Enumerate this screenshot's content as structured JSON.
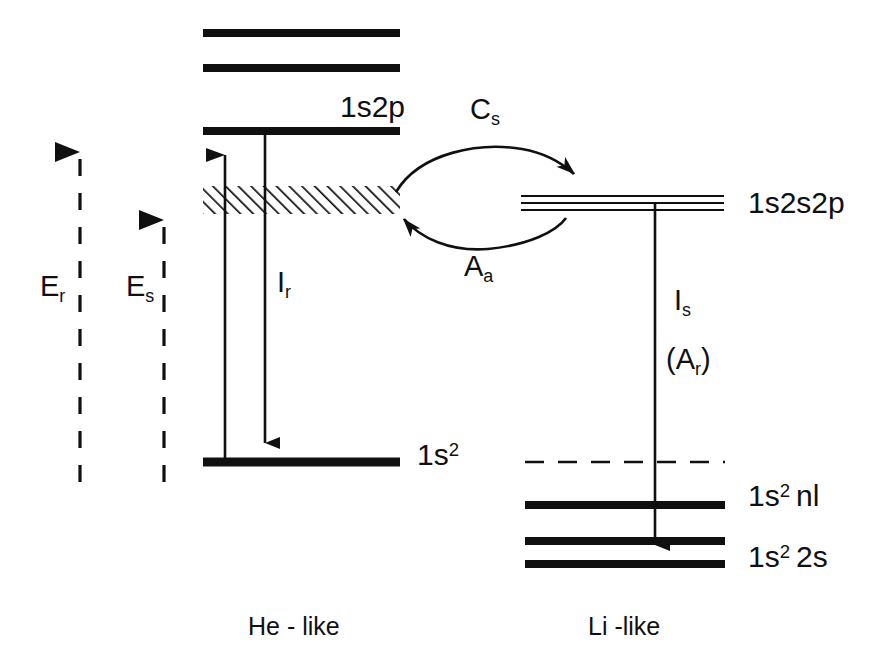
{
  "figure": {
    "type": "energy-level-diagram",
    "background_color": "#ffffff",
    "line_color": "#101010"
  },
  "columns": {
    "he_like": {
      "caption": "He - like",
      "caption_x": 248,
      "caption_y": 614
    },
    "li_like": {
      "caption": "Li -like",
      "caption_x": 588,
      "caption_y": 614
    }
  },
  "levels": [
    {
      "id": "he-upper-1",
      "label": "",
      "style": "thick",
      "x1": 203,
      "x2": 400,
      "y": 33,
      "column": "he-like"
    },
    {
      "id": "he-upper-2",
      "label": "",
      "style": "thick",
      "x1": 203,
      "x2": 400,
      "y": 68,
      "column": "he-like"
    },
    {
      "id": "he-1s2p",
      "label": "1s2p",
      "label_x": 340,
      "label_y": 92,
      "style": "thick",
      "x1": 203,
      "x2": 400,
      "y": 131,
      "column": "he-like"
    },
    {
      "id": "he-ground",
      "label": "1s",
      "label_sup": "2",
      "label_x": 417,
      "label_y": 447,
      "style": "thick",
      "x1": 203,
      "x2": 400,
      "y": 462,
      "column": "he-like"
    },
    {
      "id": "li-1s2s2p",
      "label": "1s2s2p",
      "label_x": 748,
      "label_y": 188,
      "style": "triple-thin",
      "x1": 521,
      "x2": 724,
      "y": 203,
      "column": "li-like"
    },
    {
      "id": "li-nl",
      "label": "1s",
      "label_sup": "2",
      "label_suffix": "nl",
      "label_x": 748,
      "label_y": 481,
      "style": "thick",
      "x1": 525,
      "x2": 725,
      "y": 505,
      "column": "li-like"
    },
    {
      "id": "li-2s-upper",
      "label": "",
      "style": "thick",
      "x1": 525,
      "x2": 725,
      "y": 541,
      "column": "li-like"
    },
    {
      "id": "li-2s",
      "label": "1s",
      "label_sup": "2",
      "label_suffix": "2s",
      "label_x": 748,
      "label_y": 542,
      "style": "thick",
      "x1": 525,
      "x2": 725,
      "y": 564,
      "column": "li-like"
    }
  ],
  "continuum": {
    "id": "he-continuum-band",
    "style": "hatched",
    "x1": 203,
    "x2": 400,
    "y_top": 186,
    "y_bottom": 214
  },
  "dashed_reference": {
    "id": "li-ionization-dashed",
    "x1": 525,
    "x2": 725,
    "y": 462
  },
  "energy_arrows": [
    {
      "id": "E_r",
      "label": "E",
      "label_sub": "r",
      "label_x": 40,
      "label_y": 290,
      "x": 80,
      "y_top": 128,
      "y_bottom": 482,
      "style": "dashed-up"
    },
    {
      "id": "E_s",
      "label": "E",
      "label_sub": "s",
      "label_x": 126,
      "label_y": 290,
      "x": 164,
      "y_top": 196,
      "y_bottom": 482,
      "style": "dashed-up"
    }
  ],
  "transitions": [
    {
      "id": "excitation",
      "label": "",
      "x": 225,
      "y_from": 462,
      "y_to": 136,
      "direction": "up"
    },
    {
      "id": "I_r",
      "label": "I",
      "label_sub": "r",
      "label_x": 275,
      "label_y": 285,
      "x": 265,
      "y_from": 131,
      "y_to": 458,
      "direction": "down"
    },
    {
      "id": "I_s",
      "label": "I",
      "label_sub": "s",
      "label_x": 672,
      "label_y": 300,
      "label2": "(A",
      "label2_sub": "r",
      "label2_suffix": ")",
      "label2_x": 666,
      "label2_y": 355,
      "x": 655,
      "y_from": 203,
      "y_to": 560,
      "direction": "down"
    }
  ],
  "rate_arrows": [
    {
      "id": "C_s",
      "label": "C",
      "label_sub": "s",
      "label_x": 470,
      "label_y": 110,
      "direction": "he-to-li",
      "curve": "top"
    },
    {
      "id": "A_a",
      "label": "A",
      "label_sub": "a",
      "label_x": 464,
      "label_y": 243,
      "direction": "li-to-he",
      "curve": "bottom"
    }
  ]
}
